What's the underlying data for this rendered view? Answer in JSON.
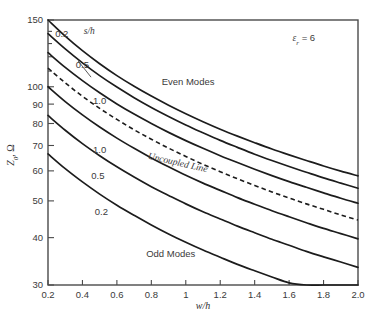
{
  "chart_data": {
    "type": "line",
    "title": "",
    "xlabel": "w/h",
    "ylabel": "Z₀, Ω",
    "xlim": [
      0.2,
      2.0
    ],
    "ylim": [
      30,
      150
    ],
    "yscale": "log",
    "xscale": "linear",
    "grid": false,
    "legend_position": "inline-annotations",
    "xticks": [
      0.2,
      0.4,
      0.6,
      0.8,
      1.0,
      1.2,
      1.4,
      1.6,
      1.8,
      2.0
    ],
    "xtick_labels": [
      "0.2",
      "0.4",
      "0.6",
      "0.8",
      "1",
      "1.2",
      "1.4",
      "1.6",
      "1.8",
      "2.0"
    ],
    "yticks": [
      30,
      40,
      50,
      60,
      70,
      80,
      90,
      100,
      150
    ],
    "ytick_labels": [
      "30",
      "40",
      "50",
      "60",
      "70",
      "80",
      "90",
      "100",
      "150"
    ],
    "annotations": [
      {
        "text": "ε",
        "sub": "r",
        "rest": " = 6",
        "x": 1.62,
        "y": 132,
        "name": "dielectric-constant-annotation"
      },
      {
        "text": "Even Modes",
        "x": 0.86,
        "y": 101,
        "name": "even-modes-label"
      },
      {
        "text": "Odd Modes",
        "x": 0.77,
        "y": 35.6,
        "name": "odd-modes-label"
      },
      {
        "text": "Uncoupled Line",
        "x": 0.95,
        "y": 62,
        "name": "uncoupled-line-label"
      },
      {
        "text": "s/h",
        "x": 0.44,
        "y": 138,
        "name": "sh-parameter-label"
      }
    ],
    "series": [
      {
        "name": "Even mode, s/h = 0.2",
        "mode": "even",
        "sh": "0.2",
        "label": "0.2",
        "label_x": 0.28,
        "label_y": 135,
        "dashed": false,
        "x": [
          0.2,
          0.3,
          0.4,
          0.5,
          0.6,
          0.7,
          0.8,
          0.9,
          1.0,
          1.1,
          1.2,
          1.3,
          1.4,
          1.5,
          1.6,
          1.7,
          1.8,
          1.9,
          2.0
        ],
        "y": [
          150.0,
          136.0,
          124.5,
          115.0,
          107.0,
          100.3,
          94.5,
          89.4,
          84.9,
          80.9,
          77.3,
          74.1,
          71.2,
          68.5,
          66.1,
          63.9,
          61.8,
          59.9,
          58.2
        ]
      },
      {
        "name": "Even mode, s/h = 0.5",
        "mode": "even",
        "sh": "0.5",
        "label": "0.5",
        "label_x": 0.4,
        "label_y": 112,
        "dashed": false,
        "x": [
          0.2,
          0.3,
          0.4,
          0.5,
          0.6,
          0.7,
          0.8,
          0.9,
          1.0,
          1.1,
          1.2,
          1.3,
          1.4,
          1.5,
          1.6,
          1.7,
          1.8,
          1.9,
          2.0
        ],
        "y": [
          138.0,
          125.8,
          115.6,
          107.0,
          99.8,
          93.6,
          88.2,
          83.5,
          79.3,
          75.6,
          72.2,
          69.2,
          66.4,
          63.9,
          61.6,
          59.5,
          57.5,
          55.7,
          54.0
        ]
      },
      {
        "name": "Even mode, s/h = 1.0",
        "mode": "even",
        "sh": "1.0",
        "label": "1.0",
        "label_x": 0.5,
        "label_y": 90,
        "dashed": false,
        "x": [
          0.2,
          0.3,
          0.4,
          0.5,
          0.6,
          0.7,
          0.8,
          0.9,
          1.0,
          1.1,
          1.2,
          1.3,
          1.4,
          1.5,
          1.6,
          1.7,
          1.8,
          1.9,
          2.0
        ],
        "y": [
          123.0,
          112.5,
          103.8,
          96.4,
          90.1,
          84.7,
          80.0,
          75.8,
          72.1,
          68.8,
          65.8,
          63.1,
          60.6,
          58.3,
          56.2,
          54.3,
          52.5,
          50.8,
          49.3
        ]
      },
      {
        "name": "Uncoupled Line",
        "mode": "uncoupled",
        "sh": "",
        "label": "",
        "label_x": 0.95,
        "label_y": 62,
        "dashed": true,
        "x": [
          0.2,
          0.3,
          0.4,
          0.5,
          0.6,
          0.7,
          0.8,
          0.9,
          1.0,
          1.1,
          1.2,
          1.3,
          1.4,
          1.5,
          1.6,
          1.7,
          1.8,
          1.9,
          2.0
        ],
        "y": [
          112.0,
          102.4,
          94.4,
          87.7,
          82.0,
          77.0,
          72.7,
          68.9,
          65.5,
          62.4,
          59.7,
          57.2,
          54.9,
          52.8,
          50.9,
          49.1,
          47.5,
          45.9,
          44.5
        ]
      },
      {
        "name": "Odd mode, s/h = 1.0",
        "mode": "odd",
        "sh": "1.0",
        "label": "1.0",
        "label_x": 0.5,
        "label_y": 67,
        "dashed": false,
        "x": [
          0.2,
          0.3,
          0.4,
          0.5,
          0.6,
          0.7,
          0.8,
          0.9,
          1.0,
          1.1,
          1.2,
          1.3,
          1.4,
          1.5,
          1.6,
          1.7,
          1.8,
          1.9,
          2.0
        ],
        "y": [
          100.0,
          91.4,
          84.3,
          78.3,
          73.2,
          68.8,
          64.9,
          61.5,
          58.4,
          55.7,
          53.3,
          51.0,
          49.0,
          47.1,
          45.4,
          43.8,
          42.3,
          41.0,
          39.7
        ]
      },
      {
        "name": "Odd mode, s/h = 0.5",
        "mode": "odd",
        "sh": "0.5",
        "label": "0.5",
        "label_x": 0.49,
        "label_y": 57,
        "dashed": false,
        "x": [
          0.2,
          0.3,
          0.4,
          0.5,
          0.6,
          0.7,
          0.8,
          0.9,
          1.0,
          1.1,
          1.2,
          1.3,
          1.4,
          1.5,
          1.6,
          1.7,
          1.8,
          1.9,
          2.0
        ],
        "y": [
          84.0,
          76.8,
          70.8,
          65.8,
          61.5,
          57.8,
          54.5,
          51.7,
          49.1,
          46.8,
          44.8,
          42.9,
          41.2,
          39.6,
          38.2,
          36.8,
          35.6,
          34.5,
          33.4
        ]
      },
      {
        "name": "Odd mode, s/h = 0.2",
        "mode": "odd",
        "sh": "0.2",
        "label": "0.2",
        "label_x": 0.51,
        "label_y": 46,
        "dashed": false,
        "x": [
          0.2,
          0.3,
          0.4,
          0.5,
          0.6,
          0.7,
          0.8,
          0.9,
          1.0,
          1.1,
          1.2,
          1.3,
          1.4,
          1.5,
          1.6,
          1.7,
          1.8,
          1.9,
          2.0
        ],
        "y": [
          66.5,
          60.8,
          56.1,
          52.1,
          48.7,
          45.8,
          43.2,
          40.9,
          38.9,
          37.1,
          35.5,
          34.0,
          32.7,
          31.5,
          30.4,
          30.0,
          30.0,
          30.0,
          30.0
        ]
      }
    ]
  }
}
